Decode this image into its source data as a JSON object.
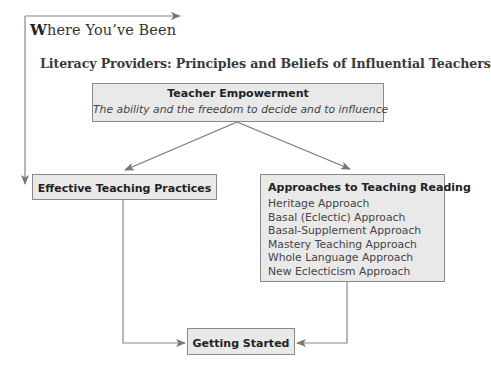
{
  "section_heading": {
    "first_letter": "W",
    "rest": "here You’ve Been"
  },
  "diagram_title": "Literacy Providers: Principles and Beliefs of Influential Teachers",
  "nodes": {
    "teacher_empowerment": {
      "title": "Teacher Empowerment",
      "subtitle": "The ability and the freedom to decide and to influence"
    },
    "effective_teaching": {
      "title": "Effective Teaching Practices"
    },
    "approaches": {
      "title": "Approaches to Teaching Reading",
      "items": [
        "Heritage Approach",
        "Basal (Eclectic) Approach",
        "Basal-Supplement Approach",
        "Mastery Teaching Approach",
        "Whole Language Approach",
        "New Eclecticism Approach"
      ]
    },
    "getting_started": {
      "title": "Getting Started"
    }
  },
  "edges": [
    {
      "from": "where_youve_been",
      "to": "effective_teaching"
    },
    {
      "from": "teacher_empowerment",
      "to": "effective_teaching"
    },
    {
      "from": "teacher_empowerment",
      "to": "approaches"
    },
    {
      "from": "effective_teaching",
      "to": "getting_started"
    },
    {
      "from": "approaches",
      "to": "getting_started"
    }
  ],
  "colors": {
    "box_fill": "#e9e9e9",
    "box_border": "#8a8a8a",
    "connector": "#808080"
  }
}
